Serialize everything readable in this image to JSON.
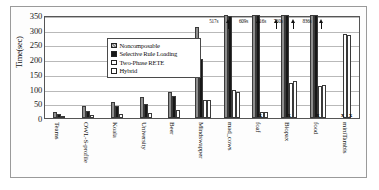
{
  "chart_data": {
    "type": "bar",
    "title": "",
    "xlabel": "",
    "ylabel": "Time(sec)",
    "ylim": [
      0,
      350
    ],
    "yticks": [
      350,
      300,
      250,
      200,
      150,
      100,
      50,
      0
    ],
    "grid": true,
    "legend_position": "upper-left-inside",
    "categories": [
      "Teams",
      "OWL-S-profile",
      "Koala",
      "University",
      "Beer",
      "Mindswapper",
      "mad_cows",
      "foaf",
      "Biopax",
      "food",
      "miniTambis"
    ],
    "series": [
      {
        "name": "Noncomposable",
        "color": "#8f8f8f",
        "values": [
          22,
          42,
          55,
          72,
          88,
          310,
          350,
          350,
          350,
          350,
          null
        ]
      },
      {
        "name": "Selective Rule Loading",
        "color": "#171717",
        "values": [
          15,
          25,
          40,
          47,
          75,
          200,
          345,
          350,
          350,
          350,
          null
        ]
      },
      {
        "name": "Two-Phase RETE",
        "color": "#ffffff",
        "values": [
          6,
          10,
          13,
          17,
          28,
          62,
          95,
          22,
          120,
          108,
          285
        ]
      },
      {
        "name": "Hybrid",
        "color": "#ffffff",
        "values": [
          null,
          null,
          null,
          null,
          null,
          62,
          88,
          22,
          125,
          112,
          283
        ]
      }
    ],
    "annotations": [
      {
        "text": "517s",
        "category": "mad_cows"
      },
      {
        "text": "609s",
        "category": "foaf"
      },
      {
        "text": "416s",
        "category": "foaf"
      },
      {
        "text": "760s",
        "category": "Biopax"
      },
      {
        "text": "836s",
        "category": "food"
      }
    ],
    "missing_markers": [
      {
        "symbol": "x",
        "category": "foaf"
      },
      {
        "symbol": "x",
        "category": "Biopax"
      },
      {
        "symbol": "x",
        "category": "food"
      },
      {
        "symbol": "x",
        "category": "miniTambis"
      },
      {
        "symbol": "x",
        "category": "miniTambis"
      }
    ]
  },
  "legend": {
    "items": [
      {
        "label": "Noncomposable",
        "swatch": "#8f8f8f"
      },
      {
        "label": "Selective Rule Loading",
        "swatch": "#171717"
      },
      {
        "label": "Two-Phase RETE",
        "swatch": "#ffffff"
      },
      {
        "label": "Hybrid",
        "swatch": "#ffffff"
      }
    ]
  }
}
